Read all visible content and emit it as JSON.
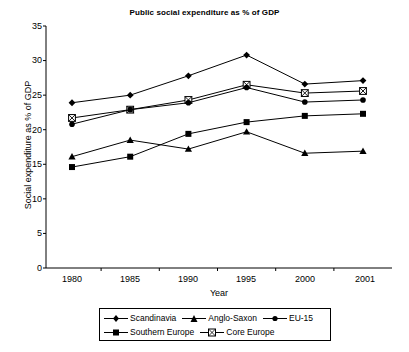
{
  "chart_data": {
    "type": "line",
    "title": "Public social expenditure as % of GDP",
    "xlabel": "Year",
    "ylabel": "Social expenditure as % of GDP",
    "categories": [
      "1980",
      "1985",
      "1990",
      "1995",
      "2000",
      "2001"
    ],
    "ylim": [
      0,
      35
    ],
    "yticks": [
      0,
      5,
      10,
      15,
      20,
      25,
      30,
      35
    ],
    "grid": false,
    "legend_position": "bottom",
    "series": [
      {
        "name": "Scandinavia",
        "marker": "diamond",
        "values": [
          23.9,
          25.0,
          27.8,
          30.8,
          26.6,
          27.1
        ]
      },
      {
        "name": "Southern Europe",
        "marker": "square",
        "values": [
          14.6,
          16.1,
          19.4,
          21.1,
          22.0,
          22.3
        ]
      },
      {
        "name": "Anglo-Saxon",
        "marker": "triangle",
        "values": [
          16.1,
          18.5,
          17.2,
          19.7,
          16.6,
          16.9
        ]
      },
      {
        "name": "Core Europe",
        "marker": "crossed-square",
        "values": [
          21.7,
          22.9,
          24.3,
          26.5,
          25.3,
          25.6
        ]
      },
      {
        "name": "EU-15",
        "marker": "circle",
        "values": [
          20.8,
          22.9,
          23.9,
          26.1,
          24.0,
          24.3
        ]
      }
    ]
  },
  "legend": {
    "items": [
      {
        "label": "Scandinavia"
      },
      {
        "label": "Anglo-Saxon"
      },
      {
        "label": "EU-15"
      },
      {
        "label": "Southern Europe"
      },
      {
        "label": "Core Europe"
      }
    ]
  },
  "axis": {
    "yticks": [
      "35",
      "30",
      "25",
      "20",
      "15",
      "10",
      "5",
      "0"
    ],
    "xticks": [
      "1980",
      "1985",
      "1990",
      "1995",
      "2000",
      "2001"
    ]
  }
}
